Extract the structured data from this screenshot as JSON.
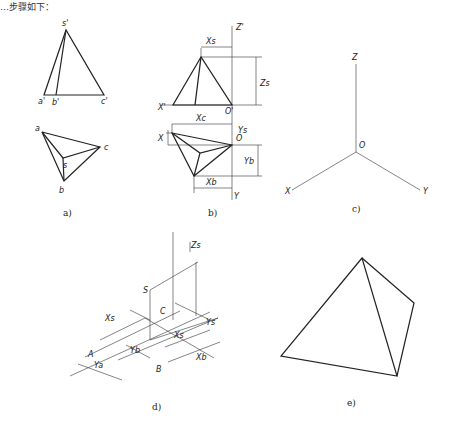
{
  "header": {
    "partial_text": "…步骤如下："
  },
  "figures": {
    "a": {
      "caption": "a)",
      "labels": {
        "s_prime": "s'",
        "a_prime": "a'",
        "b_prime": "b'",
        "c_prime": "c'",
        "a": "a",
        "b": "b",
        "c": "c",
        "s": "s"
      }
    },
    "b": {
      "caption": "b)",
      "labels": {
        "z_prime": "Z'",
        "x_prime": "X'",
        "o_prime": "O'",
        "xs": "Xs",
        "zs": "Zs",
        "x1": "X",
        "xc": "Xc",
        "yc": "Yc",
        "o": "O",
        "ys": "Ys",
        "yb": "Yb",
        "xb": "Xb",
        "y": "Y",
        "ya": "Ya"
      }
    },
    "c": {
      "caption": "c)",
      "labels": {
        "z": "Z",
        "o": "O",
        "x": "X",
        "y": "Y"
      }
    },
    "d": {
      "caption": "d)",
      "labels": {
        "zs": "Zs",
        "s": "S",
        "c": "C",
        "xs_top": "Xs",
        "ys": "Ys",
        "xs_inner": "Xs",
        "a": "A",
        "ya": "Ya",
        "yb": "Yb",
        "b": "B",
        "xb": "Xb"
      }
    },
    "e": {
      "caption": "e)"
    }
  }
}
